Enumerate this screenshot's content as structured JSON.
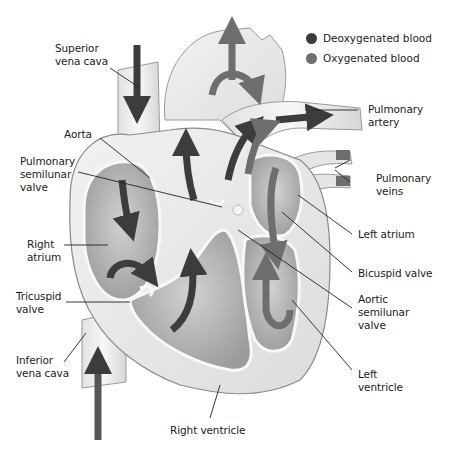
{
  "diagram": {
    "legend": [
      {
        "label": "Deoxygenated blood",
        "color": "#3c3c3c"
      },
      {
        "label": "Oxygenated blood",
        "color": "#6e6e6e"
      }
    ],
    "labels": {
      "superior_vena_cava": {
        "line1": "Superior",
        "line2": "vena cava"
      },
      "aorta": {
        "line1": "Aorta"
      },
      "pulmonary_semilunar_valve": {
        "line1": "Pulmonary",
        "line2": "semilunar",
        "line3": "valve"
      },
      "right_atrium": {
        "line1": "Right",
        "line2": "atrium"
      },
      "tricuspid_valve": {
        "line1": "Tricuspid",
        "line2": "valve"
      },
      "inferior_vena_cava": {
        "line1": "Inferior",
        "line2": "vena cava"
      },
      "right_ventricle": {
        "line1": "Right ventricle"
      },
      "pulmonary_artery": {
        "line1": "Pulmonary",
        "line2": "artery"
      },
      "pulmonary_veins": {
        "line1": "Pulmonary",
        "line2": "veins"
      },
      "left_atrium": {
        "line1": "Left atrium"
      },
      "bicuspid_valve": {
        "line1": "Bicuspid valve"
      },
      "aortic_semilunar_valve": {
        "line1": "Aortic",
        "line2": "semilunar",
        "line3": "valve"
      },
      "left_ventricle": {
        "line1": "Left",
        "line2": "ventricle"
      }
    },
    "colors": {
      "tissue": "#ececec",
      "chamber": "#b4b4b4",
      "vessel_wall": "#f4f4f4",
      "deoxygenated_arrow": "#3c3c3c",
      "oxygenated_arrow": "#6e6e6e",
      "leader_line": "#222222"
    }
  }
}
